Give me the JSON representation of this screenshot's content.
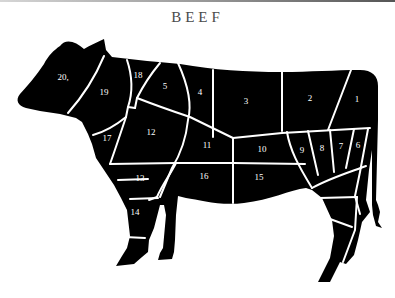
{
  "title": "BEEF",
  "colors": {
    "silhouette": "#000000",
    "cut_lines": "#ffffff",
    "labels": "#ffffff",
    "title": "#4a4a4a",
    "background": "#ffffff"
  },
  "cuts": [
    {
      "id": "1",
      "label": "1",
      "x": 357,
      "y": 102
    },
    {
      "id": "2",
      "label": "2",
      "x": 310,
      "y": 101
    },
    {
      "id": "3",
      "label": "3",
      "x": 246,
      "y": 104
    },
    {
      "id": "4",
      "label": "4",
      "x": 200,
      "y": 95
    },
    {
      "id": "5",
      "label": "5",
      "x": 165,
      "y": 89
    },
    {
      "id": "6",
      "label": "6",
      "x": 358,
      "y": 148
    },
    {
      "id": "7",
      "label": "7",
      "x": 341,
      "y": 149
    },
    {
      "id": "8",
      "label": "8",
      "x": 322,
      "y": 151
    },
    {
      "id": "9",
      "label": "9",
      "x": 302,
      "y": 153
    },
    {
      "id": "10",
      "label": "10",
      "x": 262,
      "y": 152
    },
    {
      "id": "11",
      "label": "11",
      "x": 207,
      "y": 148
    },
    {
      "id": "12",
      "label": "12",
      "x": 151,
      "y": 135
    },
    {
      "id": "13",
      "label": "13",
      "x": 140,
      "y": 181
    },
    {
      "id": "14",
      "label": "14",
      "x": 135,
      "y": 215
    },
    {
      "id": "15",
      "label": "15",
      "x": 259,
      "y": 180
    },
    {
      "id": "16",
      "label": "16",
      "x": 204,
      "y": 179
    },
    {
      "id": "17",
      "label": "17",
      "x": 107,
      "y": 141
    },
    {
      "id": "18",
      "label": "18",
      "x": 138,
      "y": 78
    },
    {
      "id": "19",
      "label": "19",
      "x": 104,
      "y": 95
    },
    {
      "id": "20",
      "label": "20,",
      "x": 63,
      "y": 80
    }
  ]
}
